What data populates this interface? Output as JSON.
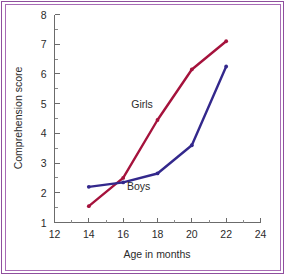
{
  "figure": {
    "border_color_outer": "#8f4f9e",
    "border_color_inner": "#a86bb5",
    "background": "#ffffff"
  },
  "chart_data": {
    "type": "line",
    "title": "",
    "xlabel": "Age in months",
    "ylabel": "Comprehension score",
    "xlim": [
      12,
      24
    ],
    "ylim": [
      1,
      8
    ],
    "xticks": [
      12,
      14,
      16,
      18,
      20,
      22,
      24
    ],
    "xtick_labels": [
      "12",
      "14",
      "16",
      "18",
      "20",
      "22",
      "24"
    ],
    "xminor_ticks": [
      13,
      15,
      17,
      19,
      21,
      23
    ],
    "yticks": [
      1,
      2,
      3,
      4,
      5,
      6,
      7,
      8
    ],
    "ytick_labels": [
      "1",
      "2",
      "3",
      "4",
      "5",
      "6",
      "7",
      "8"
    ],
    "yminor_ticks": [
      1.5,
      2.5,
      3.5,
      4.5,
      5.5,
      6.5,
      7.5
    ],
    "grid": false,
    "legend_position": "inline-annotations",
    "x": [
      14,
      16,
      18,
      20,
      22
    ],
    "series": [
      {
        "name": "Girls",
        "color": "#a5123c",
        "values": [
          1.55,
          2.5,
          4.45,
          6.15,
          7.1
        ],
        "annotation": {
          "text": "Girls",
          "x": 17.1,
          "y": 4.85
        }
      },
      {
        "name": "Boys",
        "color": "#33288c",
        "values": [
          2.2,
          2.35,
          2.65,
          3.6,
          6.25
        ],
        "annotation": {
          "text": "Boys",
          "x": 16.9,
          "y": 2.08
        }
      }
    ]
  }
}
